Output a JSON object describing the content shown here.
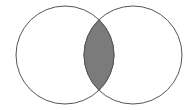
{
  "diagram": {
    "type": "venn",
    "sets": [
      {
        "name": "left-set",
        "label": ""
      },
      {
        "name": "right-set",
        "label": ""
      }
    ],
    "shaded_region": "intersection",
    "colors": {
      "circle_stroke": "#555555",
      "circle_fill": "#ffffff",
      "intersection_fill": "#7b7b7b"
    }
  }
}
